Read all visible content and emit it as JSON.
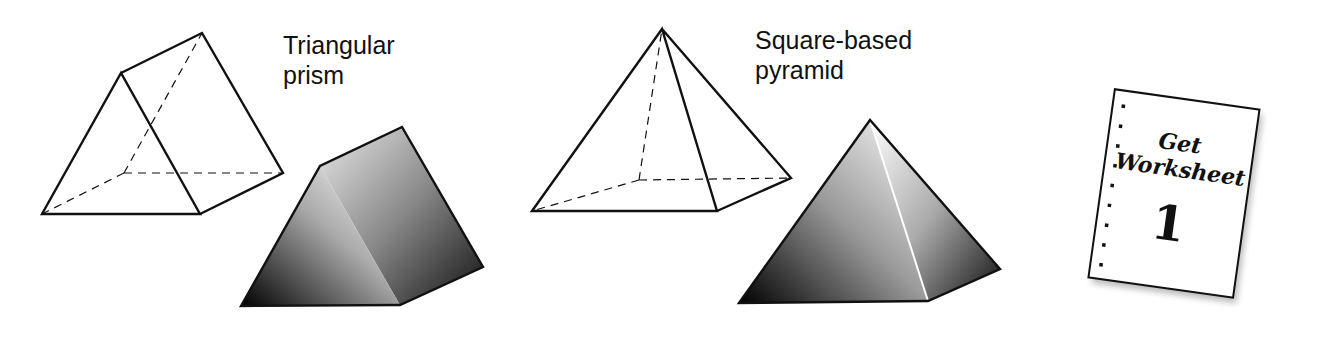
{
  "shapes": [
    {
      "name": "Triangular prism",
      "label_line1": "Triangular",
      "label_line2": "prism"
    },
    {
      "name": "Square-based pyramid",
      "label_line1": "Square-based",
      "label_line2": "pyramid"
    }
  ],
  "worksheet": {
    "line1": "Get",
    "line2": "Worksheet",
    "number": "1"
  },
  "colors": {
    "stroke": "#111111",
    "background": "#ffffff"
  }
}
